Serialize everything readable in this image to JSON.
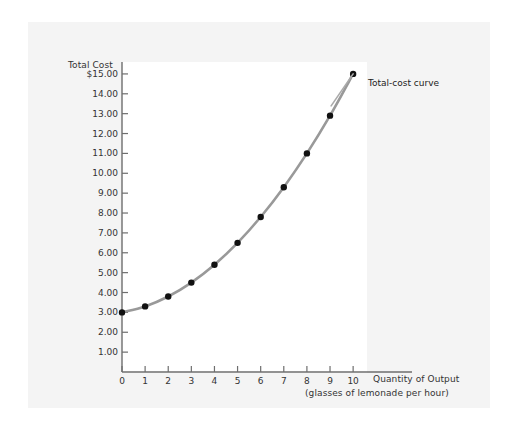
{
  "chart_data": {
    "type": "line",
    "title": "",
    "ylabel": "Total Cost",
    "xlabel": "Quantity of Output",
    "xlabel_sub": "(glasses of lemonade per hour)",
    "series_label": "Total-cost curve",
    "grid": false,
    "legend_position": "inline-right-of-last-point",
    "xlim": [
      0,
      10.6
    ],
    "ylim": [
      0,
      15.6
    ],
    "x": [
      0,
      1,
      2,
      3,
      4,
      5,
      6,
      7,
      8,
      9,
      10
    ],
    "values": [
      3.0,
      3.3,
      3.8,
      4.5,
      5.4,
      6.5,
      7.8,
      9.3,
      11.0,
      12.9,
      15.0
    ],
    "series": [
      {
        "name": "Total-cost curve",
        "values": [
          3.0,
          3.3,
          3.8,
          4.5,
          5.4,
          6.5,
          7.8,
          9.3,
          11.0,
          12.9,
          15.0
        ]
      }
    ],
    "y_ticks": [
      1,
      2,
      3,
      4,
      5,
      6,
      7,
      8,
      9,
      10,
      11,
      12,
      13,
      14,
      15
    ],
    "y_tick_labels": [
      "1.00",
      "2.00",
      "3.00",
      "4.00",
      "5.00",
      "6.00",
      "7.00",
      "8.00",
      "9.00",
      "10.00",
      "11.00",
      "12.00",
      "13.00",
      "14.00",
      "$15.00"
    ],
    "x_ticks": [
      0,
      1,
      2,
      3,
      4,
      5,
      6,
      7,
      8,
      9,
      10
    ],
    "x_tick_labels": [
      "0",
      "1",
      "2",
      "3",
      "4",
      "5",
      "6",
      "7",
      "8",
      "9",
      "10"
    ],
    "colors": {
      "curve": "#999999",
      "marker": "#111111",
      "axis": "#666666",
      "text": "#333333",
      "panel_background": "#f4f4f4",
      "plot_background": "#ffffff"
    }
  }
}
